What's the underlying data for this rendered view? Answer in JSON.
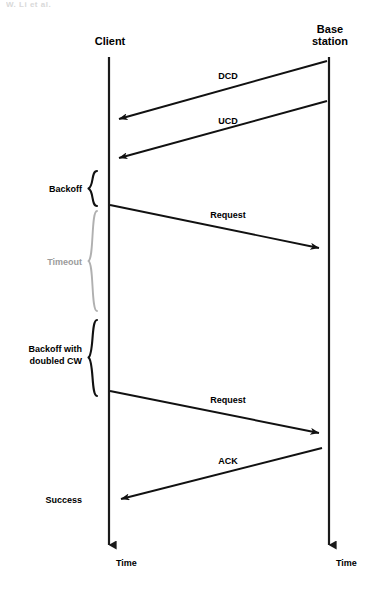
{
  "page": {
    "header_artifact": "W. Li et al.",
    "width": 376,
    "height": 591,
    "background": "#ffffff",
    "ink_color": "#111111",
    "muted_color": "#9b9b9b"
  },
  "lifelines": [
    {
      "id": "client",
      "label": "Client",
      "x": 109,
      "top": 57,
      "bottom": 551,
      "label_x": 110,
      "label_y": 45,
      "time_label": "Time",
      "time_x": 116,
      "time_y": 566
    },
    {
      "id": "base_station",
      "label": "Base station",
      "label_line1": "Base",
      "label_line2": "station",
      "x": 329,
      "top": 57,
      "bottom": 551,
      "label_x": 330,
      "label_y": 33,
      "time_label": "Time",
      "time_x": 336,
      "time_y": 566
    }
  ],
  "messages": [
    {
      "id": "dcd",
      "label": "DCD",
      "from": "base_station",
      "to": "client",
      "x1": 327,
      "y1": 61,
      "x2": 119,
      "y2": 119,
      "label_x": 228,
      "label_y": 79
    },
    {
      "id": "ucd",
      "label": "UCD",
      "from": "base_station",
      "to": "client",
      "x1": 327,
      "y1": 101,
      "x2": 119,
      "y2": 158,
      "label_x": 228,
      "label_y": 124
    },
    {
      "id": "request-1",
      "label": "Request",
      "from": "client",
      "to": "base_station",
      "x1": 110,
      "y1": 205,
      "x2": 319,
      "y2": 248,
      "label_x": 228,
      "label_y": 218
    },
    {
      "id": "request-2",
      "label": "Request",
      "from": "client",
      "to": "base_station",
      "x1": 110,
      "y1": 391,
      "x2": 319,
      "y2": 433,
      "label_x": 228,
      "label_y": 403
    },
    {
      "id": "ack",
      "label": "ACK",
      "from": "base_station",
      "to": "client",
      "x1": 322,
      "y1": 448,
      "x2": 121,
      "y2": 499,
      "label_x": 228,
      "label_y": 464
    }
  ],
  "phases": [
    {
      "id": "backoff",
      "label": "Backoff",
      "lines": [
        "Backoff"
      ],
      "muted": false,
      "top": 171,
      "bottom": 206,
      "brace_x": 92,
      "label_x": 82,
      "label_y": 192
    },
    {
      "id": "timeout",
      "label": "Timeout",
      "lines": [
        "Timeout"
      ],
      "muted": true,
      "top": 211,
      "bottom": 311,
      "brace_x": 92,
      "label_x": 82,
      "label_y": 265
    },
    {
      "id": "backoff-doubled-cw",
      "label": "Backoff with doubled CW",
      "lines": [
        "Backoff with",
        "doubled CW"
      ],
      "muted": false,
      "top": 320,
      "bottom": 396,
      "brace_x": 92,
      "label_x": 82,
      "label_y": 351
    }
  ],
  "annotations": [
    {
      "id": "success",
      "label": "Success",
      "x": 82,
      "y": 503,
      "anchor": "end",
      "muted": false
    }
  ]
}
